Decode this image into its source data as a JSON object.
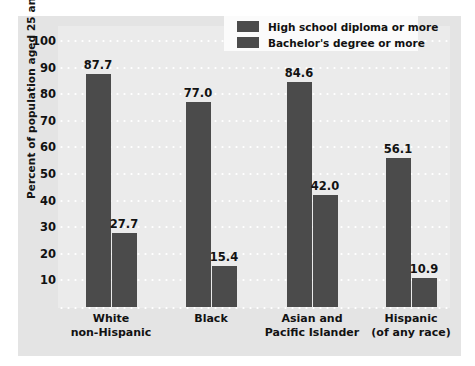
{
  "chart_data": {
    "type": "bar",
    "title": "",
    "xlabel": "",
    "ylabel": "Percent of population aged 25 and older",
    "ylim": [
      0,
      100
    ],
    "yticks": [
      100,
      90,
      80,
      70,
      60,
      50,
      40,
      30,
      20,
      10
    ],
    "grid": true,
    "legend_position": "top-right",
    "categories": [
      "White\nnon-Hispanic",
      "Black",
      "Asian and\nPacific Islander",
      "Hispanic\n(of any race)"
    ],
    "category_lines": [
      [
        "White",
        "non-Hispanic"
      ],
      [
        "Black",
        ""
      ],
      [
        "Asian and",
        "Pacific Islander"
      ],
      [
        "Hispanic",
        "(of any race)"
      ]
    ],
    "series": [
      {
        "name": "High school diploma or more",
        "color": "#4b4b4b",
        "values": [
          87.7,
          77.0,
          84.6,
          56.1
        ],
        "labels": [
          "87.7",
          "77.0",
          "84.6",
          "56.1"
        ]
      },
      {
        "name": "Bachelor's degree or more",
        "color": "#4b4b4b",
        "values": [
          27.7,
          15.4,
          42.0,
          10.9
        ],
        "labels": [
          "27.7",
          "15.4",
          "42.0",
          "10.9"
        ]
      }
    ]
  },
  "legend": {
    "items": [
      {
        "label": "High school diploma or more",
        "color": "#4b4b4b"
      },
      {
        "label": "Bachelor's degree or more",
        "color": "#4b4b4b"
      }
    ]
  },
  "axis": {
    "y_title": "Percent of population aged 25 and older",
    "y_tick_labels": [
      "100",
      "90",
      "80",
      "70",
      "60",
      "50",
      "40",
      "30",
      "20",
      "10"
    ]
  },
  "colors": {
    "bar": "#4b4b4b",
    "panel_background": "#e4e4e4",
    "plot_background": "#ebebeb",
    "gridline": "#ffffff",
    "text": "#121212",
    "legend_background": "#fbfbfb"
  }
}
